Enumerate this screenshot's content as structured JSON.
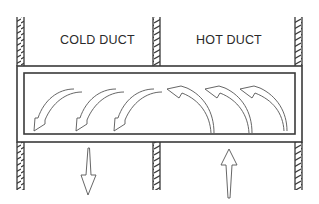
{
  "diagram": {
    "labels": {
      "cold_duct": "COLD DUCT",
      "hot_duct": "HOT DUCT"
    },
    "flow": {
      "cold_side_direction": "down",
      "hot_side_direction": "up",
      "cold_side_curved_arrows": 3,
      "hot_side_curved_arrows": 3
    },
    "colors": {
      "line": "#3a3a3a",
      "background": "#ffffff"
    }
  }
}
